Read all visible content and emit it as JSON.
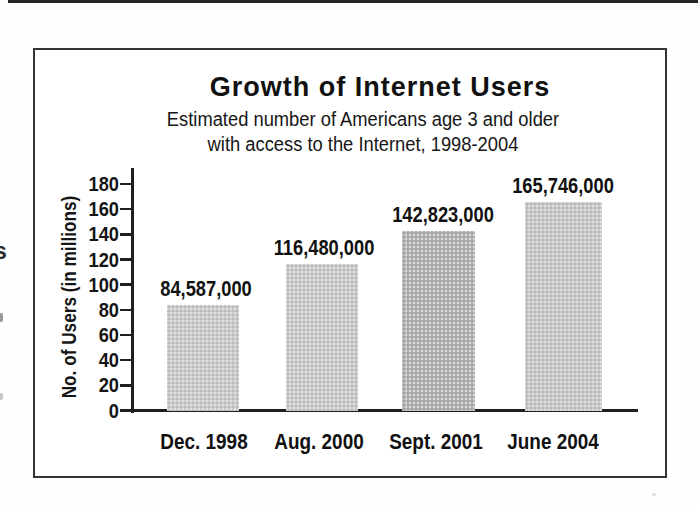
{
  "artifacts": {
    "margin_letter": "s"
  },
  "chart_data": {
    "type": "bar",
    "title": "Growth of Internet Users",
    "subtitle_lines": [
      "Estimated number of Americans age 3 and older",
      "with access to the Internet, 1998-2004"
    ],
    "ylabel": "No. of Users (in millions)",
    "xlabel": "",
    "categories": [
      "Dec. 1998",
      "Aug. 2000",
      "Sept. 2001",
      "June 2004"
    ],
    "values_millions": [
      84.587,
      116.48,
      142.823,
      165.746
    ],
    "value_labels": [
      "84,587,000",
      "116,480,000",
      "142,823,000",
      "165,746,000"
    ],
    "y_ticks": [
      0,
      20,
      40,
      60,
      80,
      100,
      120,
      140,
      160,
      180
    ],
    "ylim": [
      0,
      180
    ],
    "grid": false,
    "legend": "none",
    "bar_colors": [
      "#c9c9c9",
      "#c9c9c9",
      "#b2b2b2",
      "#c7c7c7"
    ],
    "axis_color": "#1f1f1f",
    "text_color": "#1c1c1c"
  }
}
